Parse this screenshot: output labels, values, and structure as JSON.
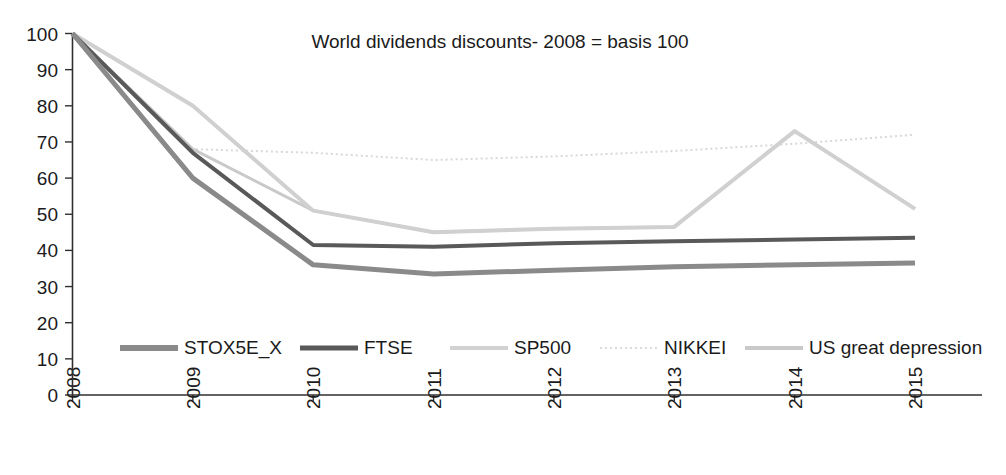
{
  "chart_data": {
    "type": "line",
    "title": "World dividends discounts- 2008 = basis 100",
    "xlabel": "",
    "ylabel": "",
    "x": [
      "2008",
      "2009",
      "2010",
      "2011",
      "2012",
      "2013",
      "2014",
      "2015"
    ],
    "categories": [
      "2008",
      "2009",
      "2010",
      "2011",
      "2012",
      "2013",
      "2014",
      "2015"
    ],
    "xlim": [
      2008,
      2015
    ],
    "ylim": [
      0,
      100
    ],
    "yticks": [
      0,
      10,
      20,
      30,
      40,
      50,
      60,
      70,
      80,
      90,
      100
    ],
    "ytick_labels": [
      "0",
      "10",
      "20",
      "30",
      "40",
      "50",
      "60",
      "70",
      "80",
      "90",
      "100"
    ],
    "grid": false,
    "legend_position": "inside-bottom-left",
    "series": [
      {
        "name": "STOX5E_X",
        "color": "#8a8a8a",
        "width": 5,
        "style": "solid",
        "values": [
          100,
          60,
          36,
          33.5,
          34.5,
          35.5,
          36,
          36.5
        ]
      },
      {
        "name": "FTSE",
        "color": "#595959",
        "width": 4,
        "style": "solid",
        "values": [
          100,
          67,
          41.5,
          41,
          42,
          42.5,
          43,
          43.5
        ]
      },
      {
        "name": "SP500",
        "color": "#d0d0d0",
        "width": 4,
        "style": "solid",
        "values": [
          100,
          80,
          51,
          45,
          46,
          46.5,
          73,
          51.5
        ]
      },
      {
        "name": "NIKKEI",
        "color": "#d8d8d8",
        "width": 2,
        "style": "dotted",
        "values": [
          100,
          68,
          67,
          65,
          66,
          67.5,
          69.5,
          72
        ]
      },
      {
        "name": "US great depression",
        "color": "#c9c9c9",
        "width": 3,
        "style": "solid",
        "values": [
          100,
          68,
          51,
          45,
          46,
          46.5,
          73,
          51.5
        ]
      }
    ]
  },
  "legend": {
    "items": [
      {
        "label": "STOX5E_X",
        "color": "#8a8a8a",
        "width": 6,
        "style": "solid"
      },
      {
        "label": "FTSE",
        "color": "#595959",
        "width": 5,
        "style": "solid"
      },
      {
        "label": "SP500",
        "color": "#d2d2d2",
        "width": 4,
        "style": "solid"
      },
      {
        "label": "NIKKEI",
        "color": "#dcdcdc",
        "width": 2,
        "style": "dotted"
      },
      {
        "label": "US great depression",
        "color": "#c9c9c9",
        "width": 4,
        "style": "solid"
      }
    ]
  },
  "axes": {
    "y_tick_labels": [
      "100",
      "90",
      "80",
      "70",
      "60",
      "50",
      "40",
      "30",
      "20",
      "10",
      "0"
    ],
    "x_tick_labels": [
      "2008",
      "2009",
      "2010",
      "2011",
      "2012",
      "2013",
      "2014",
      "2015"
    ]
  }
}
